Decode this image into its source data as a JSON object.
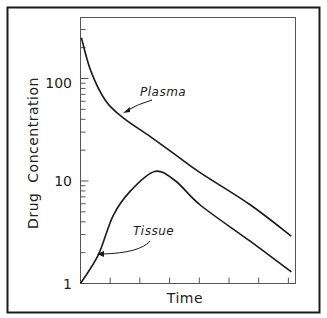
{
  "chart_data": {
    "type": "line",
    "title": "",
    "xlabel": "Time",
    "ylabel": "Drug  Concentration",
    "yscale": "log",
    "ylim": [
      1,
      400
    ],
    "xlim": [
      0,
      7.3
    ],
    "yticks": [
      {
        "value": 1,
        "label": "1"
      },
      {
        "value": 10,
        "label": "10"
      },
      {
        "value": 100,
        "label": "100"
      }
    ],
    "xtick_count": 8,
    "xtick_labels": [],
    "grid": false,
    "legend": "inline labels with arrows",
    "series": [
      {
        "name": "Plasma",
        "x": [
          0.03,
          0.34,
          0.84,
          1.45,
          2.36,
          3.2,
          4.04,
          5.7,
          7.1
        ],
        "values": [
          250,
          120,
          61,
          41,
          27,
          18,
          12,
          5.9,
          2.9
        ]
      },
      {
        "name": "Tissue",
        "x": [
          0,
          0.6,
          1.1,
          1.7,
          2.5,
          3.2,
          4.04,
          5.7,
          7.1
        ],
        "values": [
          1,
          1.9,
          4.6,
          8.1,
          12.4,
          10,
          5.8,
          2.6,
          1.3
        ]
      }
    ],
    "annotations": [
      {
        "text": "Plasma",
        "points_to": "Plasma curve"
      },
      {
        "text": "Tissue",
        "points_to": "Tissue curve"
      }
    ]
  },
  "labels": {
    "x_axis": "Time",
    "y_axis": "Drug  Concentration",
    "plasma": "Plasma",
    "tissue": "Tissue",
    "ytick_1": "1",
    "ytick_10": "10",
    "ytick_100": "100"
  },
  "colors": {
    "line": "#1a1a1a",
    "axis": "#555555",
    "background": "#ffffff"
  }
}
